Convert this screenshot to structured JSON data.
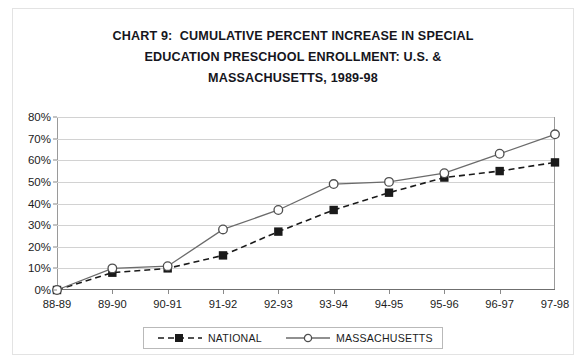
{
  "title": {
    "line1": "CHART 9:  CUMULATIVE PERCENT INCREASE IN SPECIAL",
    "line2": "EDUCATION PRESCHOOL ENROLLMENT: U.S. &",
    "line3": "MASSACHUSETTS, 1989-98"
  },
  "legend": {
    "national_label": "NATIONAL",
    "massachusetts_label": "MASSACHUSETTS"
  },
  "chart_data": {
    "type": "line",
    "title": "CHART 9:  CUMULATIVE PERCENT INCREASE IN SPECIAL EDUCATION PRESCHOOL ENROLLMENT: U.S. & MASSACHUSETTS, 1989-98",
    "xlabel": "",
    "ylabel": "",
    "categories": [
      "88-89",
      "89-90",
      "90-91",
      "91-92",
      "92-93",
      "93-94",
      "94-95",
      "95-96",
      "96-97",
      "97-98"
    ],
    "ylim": [
      0,
      80
    ],
    "ytick_values": [
      0,
      10,
      20,
      30,
      40,
      50,
      60,
      70,
      80
    ],
    "ytick_labels": [
      "0%",
      "10%",
      "20%",
      "30%",
      "40%",
      "50%",
      "60%",
      "70%",
      "80%"
    ],
    "grid": true,
    "legend_position": "bottom",
    "series": [
      {
        "name": "NATIONAL",
        "style": "dashed",
        "marker": "filled-square",
        "color": "#1a1a1a",
        "values": [
          0,
          8,
          10,
          16,
          27,
          37,
          45,
          52,
          55,
          59
        ]
      },
      {
        "name": "MASSACHUSETTS",
        "style": "solid",
        "marker": "open-circle",
        "color": "#6b6b6b",
        "values": [
          0,
          10,
          11,
          28,
          37,
          49,
          50,
          54,
          63,
          72
        ]
      }
    ]
  }
}
